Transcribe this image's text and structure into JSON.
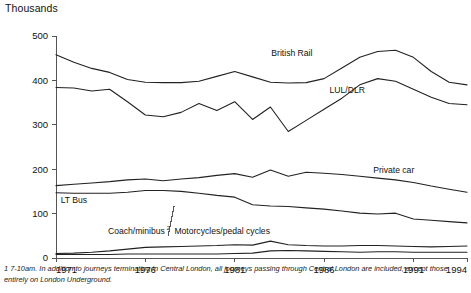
{
  "chart_data": {
    "type": "line",
    "title": "",
    "ylabel": "Thousands",
    "xlabel": "",
    "ylim": [
      0,
      500
    ],
    "xlim": [
      1971,
      1994
    ],
    "yticks": [
      0,
      100,
      200,
      300,
      400,
      500
    ],
    "ytick_labels": [
      "0",
      "100",
      "200",
      "300",
      "400",
      "500"
    ],
    "xticks": [
      1971,
      1976,
      1981,
      1986,
      1991,
      1994
    ],
    "xtick_labels": [
      "1971",
      "1976",
      "1981",
      "1986",
      "1991",
      "1994"
    ],
    "grid": false,
    "legend_position": "inline-labels",
    "x": [
      1971,
      1972,
      1973,
      1974,
      1975,
      1976,
      1977,
      1978,
      1979,
      1980,
      1981,
      1982,
      1983,
      1984,
      1985,
      1986,
      1987,
      1988,
      1989,
      1990,
      1991,
      1992,
      1993,
      1994
    ],
    "series": [
      {
        "name": "British Rail",
        "label": "British Rail",
        "values": [
          458,
          441,
          427,
          418,
          402,
          396,
          395,
          395,
          398,
          409,
          420,
          408,
          396,
          394,
          395,
          404,
          428,
          452,
          465,
          468,
          452,
          420,
          396,
          390
        ]
      },
      {
        "name": "LUL/DLR",
        "label": "LUL/DLR",
        "values": [
          384,
          383,
          376,
          380,
          352,
          322,
          318,
          328,
          348,
          332,
          352,
          312,
          340,
          285,
          310,
          335,
          360,
          390,
          404,
          398,
          380,
          362,
          348,
          345
        ]
      },
      {
        "name": "Private car",
        "label": "Private car",
        "values": [
          163,
          166,
          169,
          172,
          176,
          178,
          174,
          178,
          181,
          186,
          190,
          182,
          198,
          184,
          193,
          191,
          188,
          184,
          180,
          176,
          170,
          162,
          155,
          148
        ]
      },
      {
        "name": "LT Bus",
        "label": "LT Bus",
        "values": [
          147,
          146,
          146,
          146,
          148,
          152,
          152,
          150,
          146,
          141,
          137,
          120,
          117,
          116,
          113,
          110,
          106,
          101,
          99,
          101,
          88,
          85,
          82,
          79
        ]
      },
      {
        "name": "Coach/minibus",
        "label": "Coach/minibus",
        "footnote_marker": "2",
        "values": [
          10,
          11,
          13,
          16,
          20,
          24,
          25,
          26,
          27,
          28,
          30,
          29,
          38,
          30,
          28,
          27,
          27,
          28,
          28,
          27,
          26,
          25,
          26,
          27
        ]
      },
      {
        "name": "Motorcycles/pedal cycles",
        "label": "Motorcycles/pedal cycles",
        "values": [
          8,
          8,
          8,
          8,
          9,
          9,
          9,
          9,
          9,
          9,
          10,
          11,
          16,
          17,
          16,
          15,
          14,
          13,
          14,
          14,
          13,
          13,
          13,
          13
        ]
      }
    ],
    "annotations": [
      {
        "text": "British Rail",
        "x": 1984.2,
        "y": 455
      },
      {
        "text": "LUL/DLR",
        "x": 1987.3,
        "y": 372
      },
      {
        "text": "Private car",
        "x": 1989.9,
        "y": 192
      },
      {
        "text": "LT Bus",
        "x": 1972.0,
        "y": 123
      },
      {
        "text": "Coach/minibus",
        "x": 1975.5,
        "y": 55
      },
      {
        "text": "Motorcycles/pedal cycles",
        "x": 1980.3,
        "y": 55
      }
    ]
  },
  "footnote": {
    "marker": "1",
    "text": "7-10am. In addition to journeys terminating in Central London, all journeys passing through Central London are included, except those entirely on London Underground."
  }
}
